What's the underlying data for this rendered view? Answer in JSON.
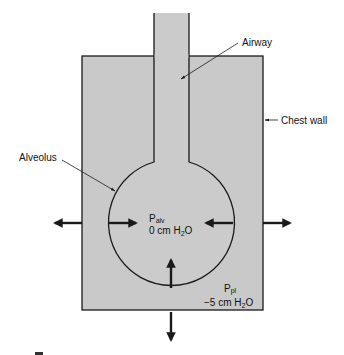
{
  "diagram": {
    "colors": {
      "fill": "#c9c9c9",
      "stroke": "#1a1a1a",
      "background": "#ffffff"
    },
    "labels": {
      "airway": "Airway",
      "chest_wall": "Chest wall",
      "alveolus": "Alveolus",
      "p_alv_symbol": "P",
      "p_alv_subscript": "alv",
      "p_alv_value_prefix": "0 cm H",
      "p_alv_value_sub": "2",
      "p_alv_value_suffix": "O",
      "p_pl_symbol": "P",
      "p_pl_subscript": "pl",
      "p_pl_value_prefix": "−5 cm H",
      "p_pl_value_sub": "2",
      "p_pl_value_suffix": "O"
    },
    "arrows": [
      {
        "name": "outward-left",
        "direction": "left"
      },
      {
        "name": "outward-right",
        "direction": "right"
      },
      {
        "name": "outward-down",
        "direction": "down"
      },
      {
        "name": "inward-from-left",
        "direction": "right"
      },
      {
        "name": "inward-from-right",
        "direction": "left"
      },
      {
        "name": "inward-from-bottom",
        "direction": "up"
      }
    ]
  }
}
